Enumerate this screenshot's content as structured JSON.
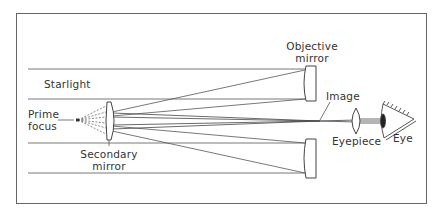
{
  "diagram": {
    "colors": {
      "line": "#555555",
      "frame": "#666666",
      "text": "#333333",
      "background": "#ffffff"
    },
    "labels": {
      "objective_mirror_line1": "Objective",
      "objective_mirror_line2": "mirror",
      "starlight": "Starlight",
      "prime_focus_line1": "Prime",
      "prime_focus_line2": "focus",
      "secondary_mirror_line1": "Secondary",
      "secondary_mirror_line2": "mirror",
      "image": "Image",
      "eyepiece": "Eyepiece",
      "eye": "Eye"
    }
  }
}
